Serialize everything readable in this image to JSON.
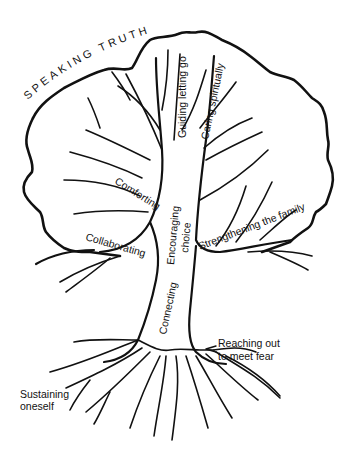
{
  "diagram": {
    "type": "labeled-tree-illustration",
    "canopy_label": "SPEAKING TRUTH",
    "branches": {
      "guiding": "Guiding letting go",
      "caring": "Caring spiritually",
      "comforting": "Comforting",
      "collaborating": "Collaborating",
      "encouraging_1": "Encouraging",
      "encouraging_2": "choice",
      "strengthening": "Strengthening the family"
    },
    "trunk": {
      "connecting": "Connecting"
    },
    "roots": {
      "reaching_1": "Reaching out",
      "reaching_2": "to meet fear",
      "sustaining_1": "Sustaining",
      "sustaining_2": "oneself"
    },
    "colors": {
      "ink": "#111111",
      "background": "#ffffff"
    }
  }
}
